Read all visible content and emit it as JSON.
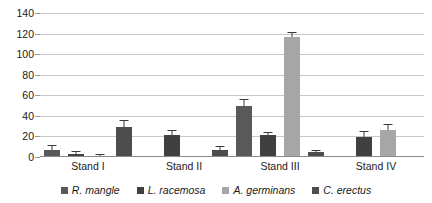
{
  "chart_data": {
    "type": "bar",
    "title": "",
    "xlabel": "",
    "ylabel": "",
    "categories": [
      "Stand I",
      "Stand II",
      "Stand III",
      "Stand IV"
    ],
    "ylim": [
      0,
      140
    ],
    "yticks": [
      0,
      20,
      40,
      60,
      80,
      100,
      120,
      140
    ],
    "ytick_labels": [
      "0",
      "20",
      "40",
      "60",
      "80",
      "100",
      "120",
      "140"
    ],
    "grid": true,
    "legend_position": "bottom",
    "series": [
      {
        "name": "R. mangle",
        "color": "#595959",
        "values": [
          7,
          0,
          50,
          0
        ],
        "errors": [
          4,
          0,
          5,
          0
        ]
      },
      {
        "name": "L. racemosa",
        "color": "#404040",
        "values": [
          3,
          21,
          21,
          19
        ],
        "errors": [
          2,
          4,
          2,
          5
        ]
      },
      {
        "name": "A. germinans",
        "color": "#a6a6a6",
        "values": [
          1,
          0,
          117,
          26
        ],
        "errors": [
          1,
          0,
          4,
          5
        ]
      },
      {
        "name": "C. erectus",
        "color": "#4d4d4d",
        "values": [
          29,
          7,
          5,
          0
        ],
        "errors": [
          6,
          3,
          1,
          0
        ]
      }
    ]
  },
  "legend": {
    "items": [
      {
        "label": "R. mangle",
        "color": "#595959"
      },
      {
        "label": "L. racemosa",
        "color": "#404040"
      },
      {
        "label": "A. germinans",
        "color": "#a6a6a6"
      },
      {
        "label": "C. erectus",
        "color": "#4d4d4d"
      }
    ]
  },
  "corner": {
    "mark": ""
  }
}
